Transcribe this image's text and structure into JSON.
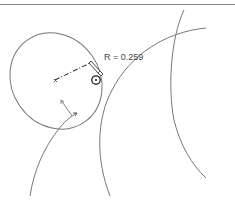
{
  "header": {
    "clipped_text": "- - - - -  - - -"
  },
  "sketch": {
    "radius_label": "R = 0.259",
    "stroke_color": "#777777",
    "accent_stroke_color": "#222222",
    "icons": {
      "dimension_marker": "pencil-edit-icon",
      "cursor_target": "circle-cursor-icon"
    }
  }
}
